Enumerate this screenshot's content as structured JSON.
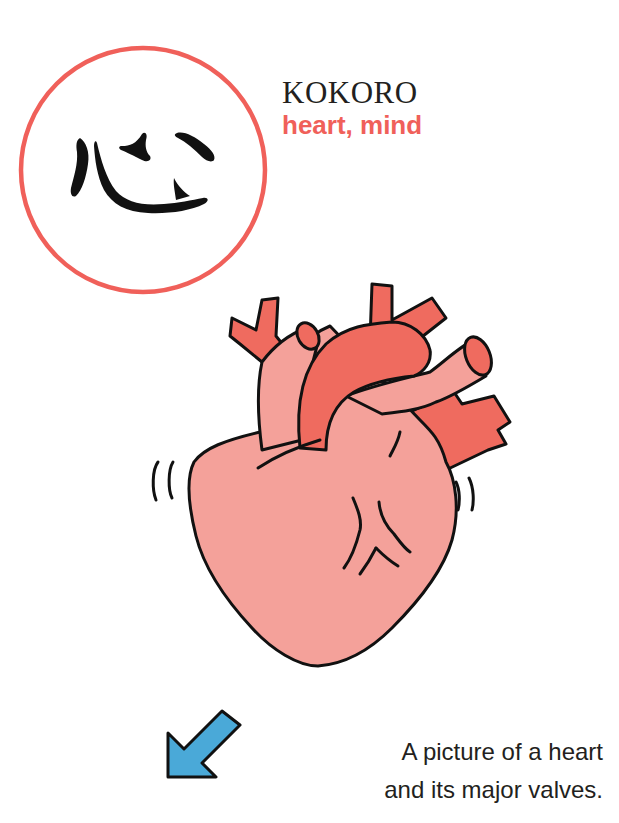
{
  "kanji": {
    "character": "心",
    "circle_color": "#f0605a",
    "ink_color": "#111111"
  },
  "title": {
    "romaji": "KOKORO",
    "meaning": "heart, mind"
  },
  "illustration": {
    "subject": "heart-with-major-vessels",
    "colors": {
      "body": "#f4a19a",
      "vessels": "#ef6b5f",
      "outline": "#111111"
    }
  },
  "pointer": {
    "icon": "arrow-down-left-icon",
    "color": "#4aa9d8"
  },
  "caption": {
    "line1": "A picture of a heart",
    "line2": "and its major valves."
  }
}
